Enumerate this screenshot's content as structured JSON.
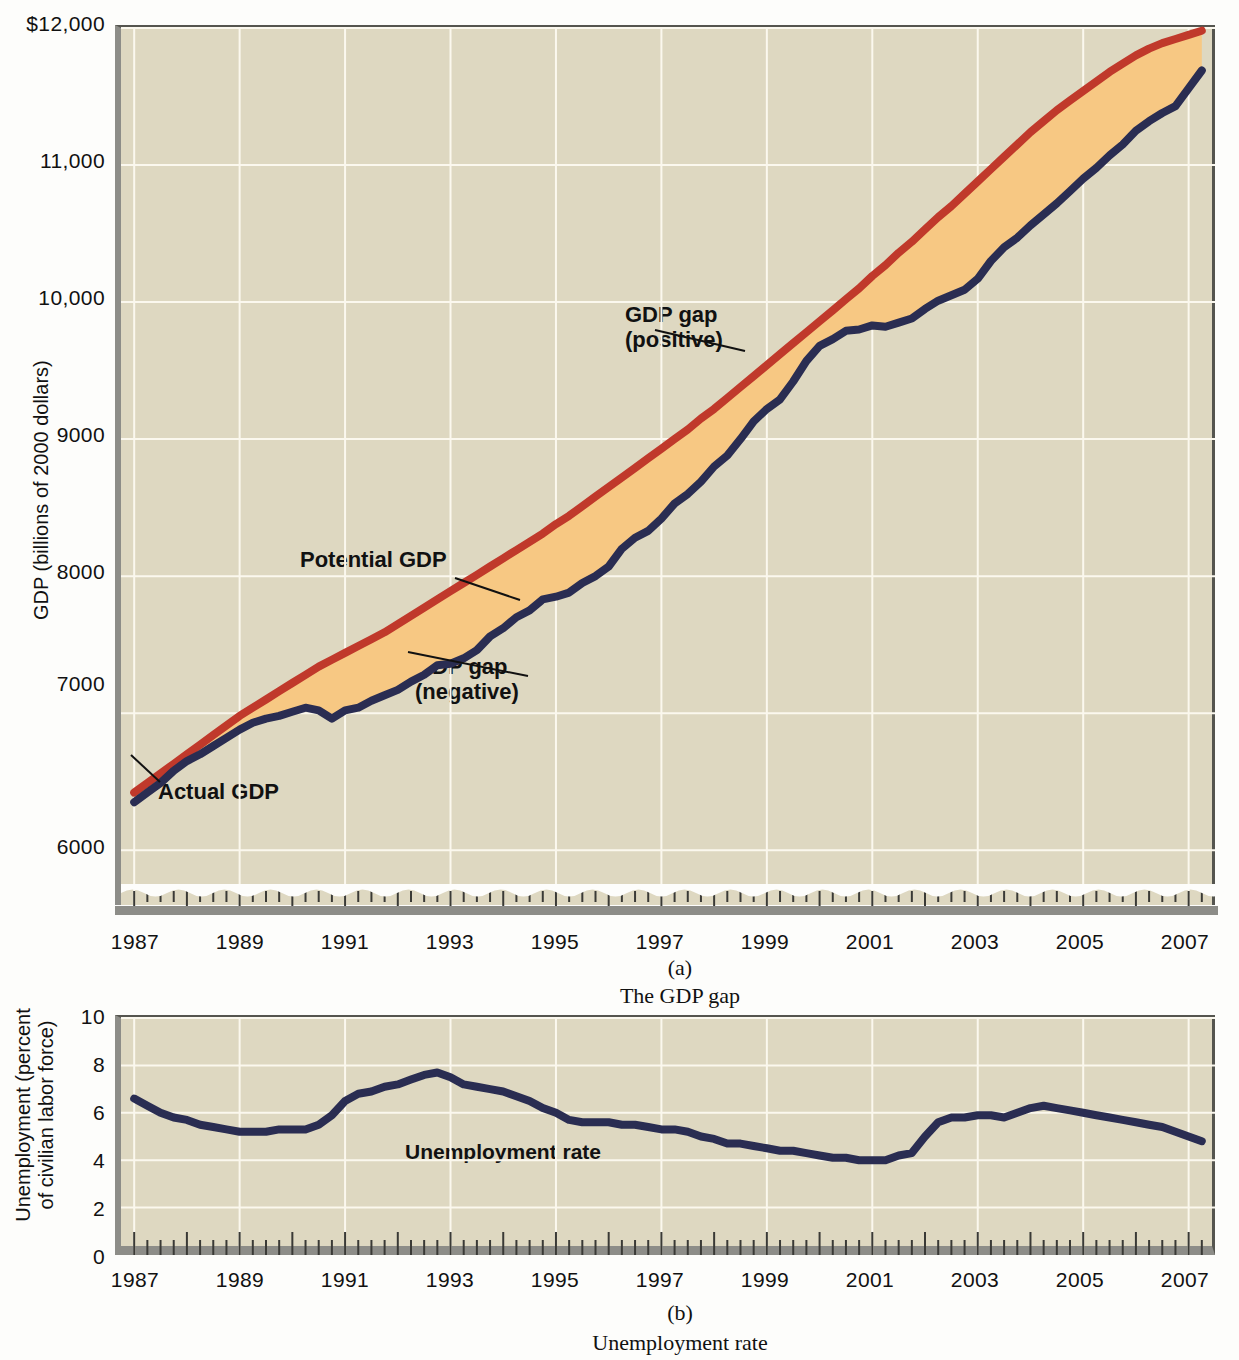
{
  "figure": {
    "panel_a": {
      "caption_number": "(a)",
      "caption_text": "The GDP gap",
      "y_axis_title": "GDP (billions of 2000 dollars)",
      "y_ticks": [
        "$12,000",
        "11,000",
        "10,000",
        "9000",
        "8000",
        "7000",
        "6000"
      ],
      "x_ticks": [
        "1987",
        "1989",
        "1991",
        "1993",
        "1995",
        "1997",
        "1999",
        "2001",
        "2003",
        "2005",
        "2007"
      ],
      "annotations": {
        "potential": "Potential GDP",
        "gap_negative": "GDP gap\n(negative)",
        "gap_positive": "GDP gap\n(positive)",
        "actual": "Actual GDP"
      }
    },
    "panel_b": {
      "caption_number": "(b)",
      "caption_text": "Unemployment rate",
      "y_axis_title": "Unemployment\n(percent of civilian\nlabor force)",
      "y_ticks": [
        "10",
        "8",
        "6",
        "4",
        "2",
        "0"
      ],
      "x_ticks": [
        "1987",
        "1989",
        "1991",
        "1993",
        "1995",
        "1997",
        "1999",
        "2001",
        "2003",
        "2005",
        "2007"
      ],
      "annotations": {
        "series": "Unemployment rate"
      }
    },
    "colors": {
      "plot_background": "#ded8c1",
      "gridline": "#fbf8ee",
      "potential_gdp_line": "#c0392b",
      "actual_gdp_line": "#2a2d52",
      "gap_positive_fill": "#a8c2de",
      "gap_negative_fill": "#f7c883",
      "axis": "#55554f"
    }
  },
  "chart_data": [
    {
      "type": "line",
      "title": "The GDP gap",
      "xlabel": "",
      "ylabel": "GDP (billions of 2000 dollars)",
      "xlim": [
        1986.75,
        2007.5
      ],
      "ylim": [
        5600,
        12000
      ],
      "ytick_values": [
        6000,
        7000,
        8000,
        9000,
        10000,
        11000,
        12000
      ],
      "xtick_values": [
        1987,
        1989,
        1991,
        1993,
        1995,
        1997,
        1999,
        2001,
        2003,
        2005,
        2007
      ],
      "grid": true,
      "legend": "inline-annotations",
      "axis_break_bottom": true,
      "x": [
        1987.0,
        1987.25,
        1987.5,
        1987.75,
        1988.0,
        1988.25,
        1988.5,
        1988.75,
        1989.0,
        1989.25,
        1989.5,
        1989.75,
        1990.0,
        1990.25,
        1990.5,
        1990.75,
        1991.0,
        1991.25,
        1991.5,
        1991.75,
        1992.0,
        1992.25,
        1992.5,
        1992.75,
        1993.0,
        1993.25,
        1993.5,
        1993.75,
        1994.0,
        1994.25,
        1994.5,
        1994.75,
        1995.0,
        1995.25,
        1995.5,
        1995.75,
        1996.0,
        1996.25,
        1996.5,
        1996.75,
        1997.0,
        1997.25,
        1997.5,
        1997.75,
        1998.0,
        1998.25,
        1998.5,
        1998.75,
        1999.0,
        1999.25,
        1999.5,
        1999.75,
        2000.0,
        2000.25,
        2000.5,
        2000.75,
        2001.0,
        2001.25,
        2001.5,
        2001.75,
        2002.0,
        2002.25,
        2002.5,
        2002.75,
        2003.0,
        2003.25,
        2003.5,
        2003.75,
        2004.0,
        2004.25,
        2004.5,
        2004.75,
        2005.0,
        2005.25,
        2005.5,
        2005.75,
        2006.0,
        2006.25,
        2006.5,
        2006.75,
        2007.0,
        2007.25
      ],
      "series": [
        {
          "name": "Actual GDP",
          "color": "#2a2d52",
          "values": [
            6350,
            6420,
            6490,
            6580,
            6650,
            6700,
            6760,
            6820,
            6880,
            6930,
            6960,
            6980,
            7010,
            7040,
            7020,
            6960,
            7020,
            7040,
            7090,
            7130,
            7170,
            7230,
            7280,
            7350,
            7360,
            7400,
            7460,
            7560,
            7620,
            7700,
            7750,
            7830,
            7850,
            7880,
            7950,
            8000,
            8070,
            8200,
            8280,
            8330,
            8420,
            8530,
            8600,
            8690,
            8800,
            8880,
            9000,
            9130,
            9220,
            9290,
            9420,
            9570,
            9680,
            9730,
            9790,
            9800,
            9830,
            9820,
            9850,
            9880,
            9950,
            10010,
            10050,
            10090,
            10170,
            10300,
            10400,
            10470,
            10560,
            10640,
            10720,
            10810,
            10900,
            10980,
            11070,
            11150,
            11250,
            11320,
            11380,
            11430,
            11560,
            11690
          ]
        },
        {
          "name": "Potential GDP",
          "color": "#c0392b",
          "values": [
            6420,
            6490,
            6560,
            6630,
            6700,
            6770,
            6840,
            6910,
            6980,
            7040,
            7100,
            7160,
            7220,
            7280,
            7340,
            7390,
            7440,
            7490,
            7540,
            7590,
            7650,
            7710,
            7770,
            7830,
            7890,
            7950,
            8010,
            8070,
            8130,
            8190,
            8250,
            8310,
            8380,
            8440,
            8510,
            8580,
            8650,
            8720,
            8790,
            8860,
            8930,
            9000,
            9070,
            9150,
            9220,
            9300,
            9380,
            9460,
            9540,
            9620,
            9700,
            9780,
            9860,
            9940,
            10020,
            10100,
            10190,
            10270,
            10360,
            10440,
            10530,
            10620,
            10700,
            10790,
            10880,
            10970,
            11060,
            11150,
            11240,
            11320,
            11400,
            11470,
            11540,
            11610,
            11680,
            11740,
            11800,
            11850,
            11890,
            11920,
            11950,
            11980
          ]
        }
      ],
      "fills": [
        {
          "name": "GDP gap (negative)",
          "color": "#f7c883",
          "where": "actual < potential"
        },
        {
          "name": "GDP gap (positive)",
          "color": "#a8c2de",
          "where": "actual > potential"
        }
      ]
    },
    {
      "type": "line",
      "title": "Unemployment rate",
      "xlabel": "",
      "ylabel": "Unemployment (percent of civilian labor force)",
      "xlim": [
        1986.75,
        2007.5
      ],
      "ylim": [
        0,
        10
      ],
      "ytick_values": [
        0,
        2,
        4,
        6,
        8,
        10
      ],
      "xtick_values": [
        1987,
        1989,
        1991,
        1993,
        1995,
        1997,
        1999,
        2001,
        2003,
        2005,
        2007
      ],
      "grid": true,
      "x": [
        1987.0,
        1987.25,
        1987.5,
        1987.75,
        1988.0,
        1988.25,
        1988.5,
        1988.75,
        1989.0,
        1989.25,
        1989.5,
        1989.75,
        1990.0,
        1990.25,
        1990.5,
        1990.75,
        1991.0,
        1991.25,
        1991.5,
        1991.75,
        1992.0,
        1992.25,
        1992.5,
        1992.75,
        1993.0,
        1993.25,
        1993.5,
        1993.75,
        1994.0,
        1994.25,
        1994.5,
        1994.75,
        1995.0,
        1995.25,
        1995.5,
        1995.75,
        1996.0,
        1996.25,
        1996.5,
        1996.75,
        1997.0,
        1997.25,
        1997.5,
        1997.75,
        1998.0,
        1998.25,
        1998.5,
        1998.75,
        1999.0,
        1999.25,
        1999.5,
        1999.75,
        2000.0,
        2000.25,
        2000.5,
        2000.75,
        2001.0,
        2001.25,
        2001.5,
        2001.75,
        2002.0,
        2002.25,
        2002.5,
        2002.75,
        2003.0,
        2003.25,
        2003.5,
        2003.75,
        2004.0,
        2004.25,
        2004.5,
        2004.75,
        2005.0,
        2005.25,
        2005.5,
        2005.75,
        2006.0,
        2006.25,
        2006.5,
        2006.75,
        2007.0,
        2007.25
      ],
      "series": [
        {
          "name": "Unemployment rate",
          "color": "#2a2d52",
          "values": [
            6.6,
            6.3,
            6.0,
            5.8,
            5.7,
            5.5,
            5.4,
            5.3,
            5.2,
            5.2,
            5.2,
            5.3,
            5.3,
            5.3,
            5.5,
            5.9,
            6.5,
            6.8,
            6.9,
            7.1,
            7.2,
            7.4,
            7.6,
            7.7,
            7.5,
            7.2,
            7.1,
            7.0,
            6.9,
            6.7,
            6.5,
            6.2,
            6.0,
            5.7,
            5.6,
            5.6,
            5.6,
            5.5,
            5.5,
            5.4,
            5.3,
            5.3,
            5.2,
            5.0,
            4.9,
            4.7,
            4.7,
            4.6,
            4.5,
            4.4,
            4.4,
            4.3,
            4.2,
            4.1,
            4.1,
            4.0,
            4.0,
            4.0,
            4.2,
            4.3,
            5.0,
            5.6,
            5.8,
            5.8,
            5.9,
            5.9,
            5.8,
            6.0,
            6.2,
            6.3,
            6.2,
            6.1,
            6.0,
            5.9,
            5.8,
            5.7,
            5.6,
            5.5,
            5.4,
            5.2,
            5.0,
            4.8,
            4.7,
            4.6,
            4.6,
            4.7,
            4.8,
            5.0,
            5.1
          ]
        }
      ]
    }
  ]
}
